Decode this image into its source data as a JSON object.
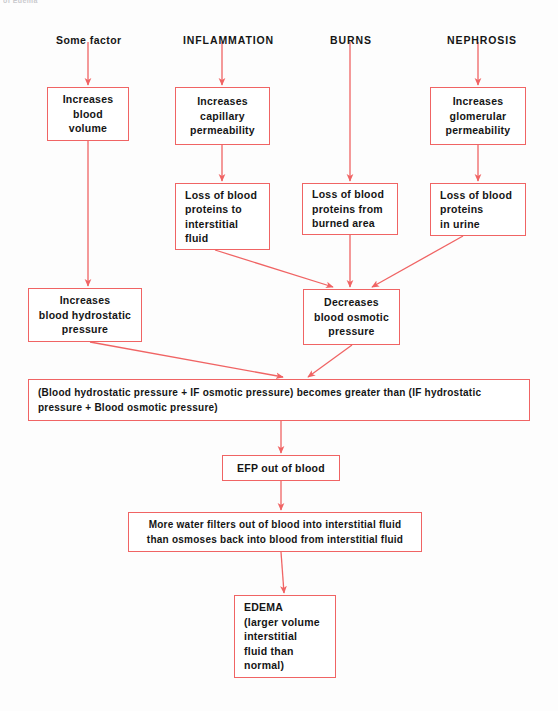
{
  "page": {
    "cropped_header_text": "of Edema",
    "width": 558,
    "height": 711,
    "line_color": "#f06464",
    "text_color": "#151515",
    "background": "#fdfdfd"
  },
  "headings": [
    {
      "id": "some-factor",
      "text": "Some factor",
      "x": 56,
      "y": 34
    },
    {
      "id": "inflammation",
      "text": "INFLAMMATION",
      "x": 183,
      "y": 34
    },
    {
      "id": "burns",
      "text": "BURNS",
      "x": 330,
      "y": 34
    },
    {
      "id": "nephrosis",
      "text": "NEPHROSIS",
      "x": 447,
      "y": 34
    }
  ],
  "boxes": [
    {
      "id": "increases-blood-volume",
      "lines": [
        "Increases",
        "blood",
        "volume"
      ],
      "x": 47,
      "y": 87,
      "w": 82,
      "h": 54,
      "align": "center"
    },
    {
      "id": "increases-capillary-permeability",
      "lines": [
        "Increases",
        "capillary",
        "permeability"
      ],
      "x": 175,
      "y": 87,
      "w": 95,
      "h": 58,
      "align": "center"
    },
    {
      "id": "increases-glomerular-permeability",
      "lines": [
        "Increases",
        "glomerular",
        "permeability"
      ],
      "x": 430,
      "y": 87,
      "w": 96,
      "h": 58,
      "align": "center"
    },
    {
      "id": "loss-proteins-interstitial-fluid",
      "lines": [
        "Loss of blood",
        "proteins to",
        "interstitial",
        "fluid"
      ],
      "x": 175,
      "y": 183,
      "w": 95,
      "h": 67,
      "align": "left"
    },
    {
      "id": "loss-proteins-burned-area",
      "lines": [
        "Loss of blood",
        "proteins from",
        "burned area"
      ],
      "x": 302,
      "y": 183,
      "w": 96,
      "h": 52,
      "align": "left"
    },
    {
      "id": "loss-proteins-in-urine",
      "lines": [
        "Loss of blood",
        "proteins",
        "in urine"
      ],
      "x": 430,
      "y": 183,
      "w": 96,
      "h": 53,
      "align": "left"
    },
    {
      "id": "increases-blood-hydrostatic-pressure",
      "lines": [
        "Increases",
        "blood hydrostatic",
        "pressure"
      ],
      "x": 28,
      "y": 288,
      "w": 114,
      "h": 54,
      "align": "center"
    },
    {
      "id": "decreases-blood-osmotic-pressure",
      "lines": [
        "Decreases",
        "blood osmotic",
        "pressure"
      ],
      "x": 303,
      "y": 289,
      "w": 97,
      "h": 56,
      "align": "center"
    },
    {
      "id": "pressure-inequality",
      "lines": [
        "(Blood hydrostatic pressure  +  IF osmotic pressure) becomes greater than (IF hydrostatic",
        "pressure  +  Blood osmotic pressure)"
      ],
      "x": 28,
      "y": 379,
      "w": 502,
      "h": 42,
      "align": "left"
    },
    {
      "id": "efp-out-of-blood",
      "lines": [
        "EFP out of blood"
      ],
      "x": 222,
      "y": 455,
      "w": 118,
      "h": 26,
      "align": "center"
    },
    {
      "id": "more-water-filters",
      "lines": [
        "More water filters out of blood into interstitial fluid",
        "than osmoses back into blood from interstitial fluid"
      ],
      "x": 128,
      "y": 512,
      "w": 294,
      "h": 40,
      "align": "center"
    },
    {
      "id": "edema",
      "lines": [
        "EDEMA",
        "(larger volume",
        "interstitial",
        "fluid than",
        "normal)"
      ],
      "x": 234,
      "y": 595,
      "w": 102,
      "h": 83,
      "align": "left"
    }
  ],
  "connectors": [
    {
      "id": "some-factor-to-increases-blood-volume",
      "from": "Some factor",
      "to": "Increases blood volume"
    },
    {
      "id": "inflammation-to-increases-capillary-permeability",
      "from": "INFLAMMATION",
      "to": "Increases capillary permeability"
    },
    {
      "id": "nephrosis-to-increases-glomerular-permeability",
      "from": "NEPHROSIS",
      "to": "Increases glomerular permeability"
    },
    {
      "id": "capillary-permeability-to-loss-interstitial",
      "from": "Increases capillary permeability",
      "to": "Loss of blood proteins to interstitial fluid"
    },
    {
      "id": "burns-to-loss-burned-area",
      "from": "BURNS",
      "to": "Loss of blood proteins from burned area"
    },
    {
      "id": "glomerular-permeability-to-loss-urine",
      "from": "Increases glomerular permeability",
      "to": "Loss of blood proteins in urine"
    },
    {
      "id": "blood-volume-to-hydrostatic-pressure",
      "from": "Increases blood volume",
      "to": "Increases blood hydrostatic pressure"
    },
    {
      "id": "loss-interstitial-to-decreases-osmotic",
      "from": "Loss of blood proteins to interstitial fluid",
      "to": "Decreases blood osmotic pressure"
    },
    {
      "id": "loss-burned-to-decreases-osmotic",
      "from": "Loss of blood proteins from burned area",
      "to": "Decreases blood osmotic pressure"
    },
    {
      "id": "loss-urine-to-decreases-osmotic",
      "from": "Loss of blood proteins in urine",
      "to": "Decreases blood osmotic pressure"
    },
    {
      "id": "hydrostatic-to-inequality",
      "from": "Increases blood hydrostatic pressure",
      "to": "pressure inequality statement"
    },
    {
      "id": "osmotic-to-inequality",
      "from": "Decreases blood osmotic pressure",
      "to": "pressure inequality statement"
    },
    {
      "id": "inequality-to-efp",
      "from": "pressure inequality statement",
      "to": "EFP out of blood"
    },
    {
      "id": "efp-to-more-water",
      "from": "EFP out of blood",
      "to": "More water filters out of blood"
    },
    {
      "id": "more-water-to-edema",
      "from": "More water filters out of blood",
      "to": "EDEMA"
    }
  ]
}
